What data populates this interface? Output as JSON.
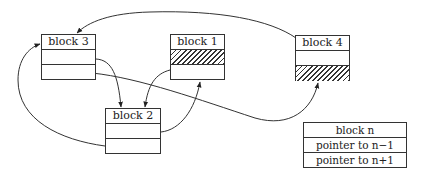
{
  "diagram": {
    "type": "linked-list-memory-blocks",
    "blocks": [
      {
        "id": "block3",
        "label": "block 3",
        "rows": [
          "empty",
          "empty"
        ]
      },
      {
        "id": "block1",
        "label": "block 1",
        "rows": [
          "hatched",
          "empty"
        ]
      },
      {
        "id": "block4",
        "label": "block 4",
        "rows": [
          "empty",
          "hatched"
        ]
      },
      {
        "id": "block2",
        "label": "block 2",
        "rows": [
          "empty",
          "empty"
        ]
      }
    ],
    "edges": [
      {
        "from": "block4",
        "to": "block3",
        "desc": "curve from block 4 top to block 3 top"
      },
      {
        "from": "block3",
        "to": "block2",
        "desc": "block 3 row1 to block 2 header"
      },
      {
        "from": "block3",
        "to": "block4",
        "desc": "block 3 row2 to block 4 bottom"
      },
      {
        "from": "block1",
        "to": "block2",
        "desc": "block 1 row2 to block 2 header"
      },
      {
        "from": "block2",
        "to": "block1",
        "desc": "block 2 row1 to block 1 bottom"
      },
      {
        "from": "block2",
        "to": "block3",
        "desc": "block 2 row2 loop to block 3 left"
      }
    ],
    "legend": {
      "title": "block n",
      "row1": "pointer to n−1",
      "row2": "pointer to n+1"
    }
  }
}
